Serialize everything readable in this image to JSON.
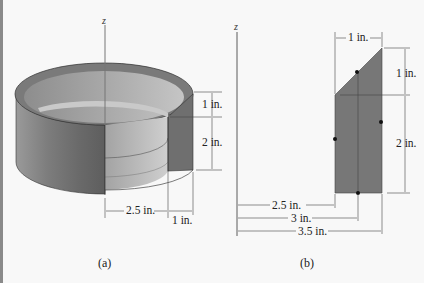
{
  "figure_a": {
    "axis_label": "z",
    "dims": {
      "top_height": "1 in.",
      "bottom_height": "2 in.",
      "inner_radius": "2.5 in.",
      "thickness": "1 in."
    },
    "caption": "(a)"
  },
  "figure_b": {
    "axis_label": "z",
    "dims": {
      "top_width": "1 in.",
      "top_height": "1 in.",
      "bottom_height": "2 in.",
      "r1": "2.5 in.",
      "r2": "3 in.",
      "r3": "3.5 in."
    },
    "caption": "(b)"
  },
  "colors": {
    "shell_dark": "#6b6b6b",
    "shell_light": "#b5b5b5",
    "section_fill": "#777777",
    "background": "#f8f8f8"
  }
}
